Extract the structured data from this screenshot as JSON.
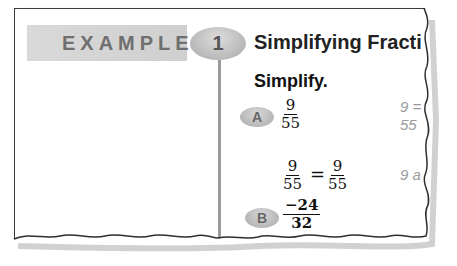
{
  "example": {
    "label": "EXAMPLE",
    "number": "1",
    "title": "Simplifying Fracti"
  },
  "instruction": "Simplify.",
  "parts": [
    {
      "label": "A",
      "fraction": {
        "numerator": "9",
        "denominator": "55"
      },
      "work": {
        "left": {
          "numerator": "9",
          "denominator": "55"
        },
        "operator": "=",
        "right": {
          "numerator": "9",
          "denominator": "55"
        }
      },
      "side_notes": [
        "9 =",
        "55",
        "9 a"
      ]
    },
    {
      "label": "B",
      "fraction": {
        "numerator": "−24",
        "denominator": "32"
      },
      "cut_text": "−24 = −24 ÷ 8"
    }
  ],
  "colors": {
    "banner": "#d3d3d3",
    "label_text": "#6f6f6f",
    "oval": "#b8b8b8",
    "side_note": "#9a9a9a",
    "divider": "#9a9a9a"
  }
}
